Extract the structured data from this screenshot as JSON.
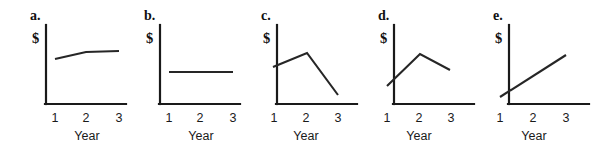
{
  "figure": {
    "background_color": "#ffffff",
    "line_color": "#262626",
    "axis_color": "#1a1a1a",
    "y_axis_label": "$",
    "x_axis_label": "Year",
    "x_tick_labels": [
      "1",
      "2",
      "3"
    ]
  },
  "chart_data": [
    {
      "type": "line",
      "title": "a.",
      "xlabel": "Year",
      "ylabel": "$",
      "categories": [
        "1",
        "2",
        "3"
      ],
      "x": [
        1,
        2,
        3
      ],
      "values": [
        38,
        52,
        54
      ],
      "ylim": [
        0,
        100
      ],
      "grid": false,
      "legend": "none",
      "description": "rises then levels off"
    },
    {
      "type": "line",
      "title": "b.",
      "xlabel": "Year",
      "ylabel": "$",
      "categories": [
        "1",
        "2",
        "3"
      ],
      "x": [
        1,
        2,
        3
      ],
      "values": [
        40,
        40,
        40
      ],
      "ylim": [
        0,
        100
      ],
      "grid": false,
      "legend": "none",
      "description": "flat, no change"
    },
    {
      "type": "line",
      "title": "c.",
      "xlabel": "Year",
      "ylabel": "$",
      "categories": [
        "1",
        "2",
        "3"
      ],
      "x": [
        1,
        2,
        3
      ],
      "values": [
        47,
        65,
        12
      ],
      "ylim": [
        0,
        100
      ],
      "grid": false,
      "legend": "none",
      "description": "rises to a peak then falls below start"
    },
    {
      "type": "line",
      "title": "d.",
      "xlabel": "Year",
      "ylabel": "$",
      "categories": [
        "1",
        "2",
        "3"
      ],
      "x": [
        1,
        2,
        3
      ],
      "values": [
        24,
        64,
        44
      ],
      "ylim": [
        0,
        100
      ],
      "grid": false,
      "legend": "none",
      "description": "rises to a peak then falls, ending above start"
    },
    {
      "type": "line",
      "title": "e.",
      "xlabel": "Year",
      "ylabel": "$",
      "categories": [
        "1",
        "2",
        "3"
      ],
      "x": [
        1,
        2,
        3
      ],
      "values": [
        10,
        36,
        62
      ],
      "ylim": [
        0,
        100
      ],
      "grid": false,
      "legend": "none",
      "description": "steady straight increase"
    }
  ],
  "panels": [
    {
      "letter": "a.",
      "left": 14,
      "letter_x": 16,
      "letter_y": 20,
      "dollar_x": 18,
      "dollar_y": 43,
      "axis_x": 32,
      "axis_top": 25,
      "axis_bottom": 104,
      "axis_right": 112,
      "polyline": "41,59 72,52 105,51",
      "tick_xs": [
        41,
        72,
        105
      ],
      "tick_y": 122,
      "title_x": 73,
      "title_y": 140
    },
    {
      "letter": "b.",
      "left": 128,
      "letter_x": 16,
      "letter_y": 20,
      "dollar_x": 18,
      "dollar_y": 43,
      "axis_x": 32,
      "axis_top": 25,
      "axis_bottom": 104,
      "axis_right": 112,
      "polyline": "41,72 73,72 105,72",
      "tick_xs": [
        41,
        72,
        105
      ],
      "tick_y": 122,
      "title_x": 73,
      "title_y": 140
    },
    {
      "letter": "c.",
      "left": 245,
      "letter_x": 16,
      "letter_y": 20,
      "dollar_x": 18,
      "dollar_y": 43,
      "axis_x": 32,
      "axis_top": 25,
      "axis_bottom": 104,
      "axis_right": 112,
      "polyline": "28,67 62,53 93,95",
      "tick_xs": [
        29,
        61,
        93
      ],
      "tick_y": 122,
      "title_x": 61,
      "title_y": 140
    },
    {
      "letter": "d.",
      "left": 362,
      "letter_x": 16,
      "letter_y": 20,
      "dollar_x": 18,
      "dollar_y": 43,
      "axis_x": 32,
      "axis_top": 25,
      "axis_bottom": 104,
      "axis_right": 112,
      "polyline": "25,86 58,54 88,70",
      "tick_xs": [
        25,
        57,
        89
      ],
      "tick_y": 122,
      "title_x": 57,
      "title_y": 140
    },
    {
      "letter": "e.",
      "left": 477,
      "letter_x": 16,
      "letter_y": 20,
      "dollar_x": 18,
      "dollar_y": 43,
      "axis_x": 32,
      "axis_top": 25,
      "axis_bottom": 104,
      "axis_right": 112,
      "polyline": "23,97 89,55",
      "tick_xs": [
        23,
        56,
        89
      ],
      "tick_y": 122,
      "title_x": 57,
      "title_y": 140
    }
  ]
}
